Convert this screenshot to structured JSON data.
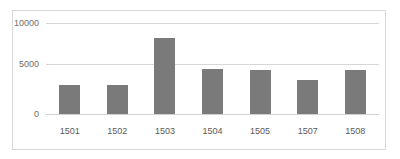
{
  "chart_data": {
    "type": "bar",
    "title": "",
    "subtitle": "",
    "xlabel": "",
    "ylabel": "",
    "categories": [
      "1501",
      "1502",
      "1503",
      "1504",
      "1505",
      "1507",
      "1508"
    ],
    "values": [
      3150,
      3200,
      8300,
      4900,
      4850,
      3700,
      4850
    ],
    "ylim": [
      0,
      10000
    ],
    "yticks": [
      "0",
      "5000",
      "10000"
    ],
    "ytick_values": [
      0,
      5000,
      10000
    ],
    "grid": true,
    "legend": "none",
    "legend_position": "none",
    "annotations": [],
    "series": [
      {
        "name": "",
        "values": [
          3150,
          3200,
          8300,
          4900,
          4850,
          3700,
          4850
        ]
      }
    ]
  },
  "style": {
    "bar_color": "#7a7a7a",
    "gridline_color": "#d6d6d6",
    "frame_color": "#d9d9d9",
    "tick_text_color": "#6e6e6e",
    "background": "#ffffff"
  }
}
